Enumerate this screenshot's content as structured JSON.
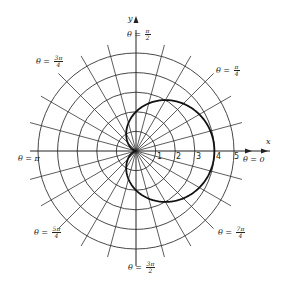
{
  "chart_data": {
    "type": "polar-line",
    "title": "",
    "equation": "r = 2 + 2cos(theta)",
    "curve_name": "cardioid",
    "xlabel": "x",
    "ylabel": "y",
    "rlim": [
      0,
      5
    ],
    "r_ticks": [
      "1",
      "2",
      "3",
      "4",
      "5"
    ],
    "angle_step_deg": 15,
    "grid": true,
    "series": [
      {
        "name": "r = 2 + 2cos θ",
        "theta_deg": [
          0,
          30,
          60,
          90,
          120,
          150,
          180,
          210,
          240,
          270,
          300,
          330,
          360
        ],
        "r": [
          4.0,
          3.73,
          3.0,
          2.0,
          1.0,
          0.27,
          0.0,
          0.27,
          1.0,
          2.0,
          3.0,
          3.73,
          4.0
        ]
      }
    ],
    "angle_labels": [
      {
        "key": "t0",
        "prefix": "θ = ",
        "text": "0"
      },
      {
        "key": "t1",
        "prefix": "θ = ",
        "num": "π",
        "den": "4"
      },
      {
        "key": "t2",
        "prefix": "θ = ",
        "num": "π",
        "den": "2"
      },
      {
        "key": "t3",
        "prefix": "θ = ",
        "num": "3π",
        "den": "4"
      },
      {
        "key": "t4",
        "prefix": "θ = ",
        "text": "π"
      },
      {
        "key": "t5",
        "prefix": "θ = ",
        "num": "5π",
        "den": "4"
      },
      {
        "key": "t6",
        "prefix": "θ = ",
        "num": "3π",
        "den": "2"
      },
      {
        "key": "t7",
        "prefix": "θ = ",
        "num": "7π",
        "den": "4"
      }
    ]
  },
  "labels": {
    "x_axis": "x",
    "y_axis": "y",
    "theta_prefix": "θ = ",
    "zero": "0",
    "pi": "π",
    "pi_over_4_num": "π",
    "pi_over_4_den": "4",
    "pi_over_2_num": "π",
    "pi_over_2_den": "2",
    "three_pi_over_4_num": "3π",
    "three_pi_over_4_den": "4",
    "five_pi_over_4_num": "5π",
    "five_pi_over_4_den": "4",
    "three_pi_over_2_num": "3π",
    "three_pi_over_2_den": "2",
    "seven_pi_over_4_num": "7π",
    "seven_pi_over_4_den": "4",
    "ticks": [
      "1",
      "2",
      "3",
      "4",
      "5"
    ]
  },
  "style": {
    "grid_color": "#333333",
    "curve_color": "#111111"
  }
}
